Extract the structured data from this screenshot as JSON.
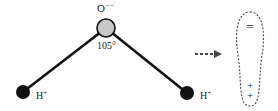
{
  "diagram": {
    "oxygen": {
      "label": "O",
      "charge": "−−",
      "fill": "#c8c8c8"
    },
    "angle_label": "105°",
    "hydrogen_left": {
      "label": "H",
      "charge": "+"
    },
    "hydrogen_right": {
      "label": "H",
      "charge": "+"
    },
    "dipole": {
      "negative_symbol": "=",
      "positive_symbols": [
        "+",
        "+"
      ]
    },
    "colors": {
      "bond": "#111111",
      "hydrogen": "#111111",
      "oxygen": "#c8c8c8",
      "dashed": "#444444"
    }
  }
}
